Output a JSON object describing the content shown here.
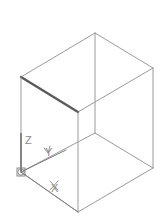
{
  "viewport": {
    "width": 168,
    "height": 224,
    "background": "#ffffff",
    "label": "CAD Model Viewport"
  },
  "model": {
    "name": "Isometric Box Wireframe",
    "projection": "isometric",
    "shape": "rectangular box",
    "edge_color": "#9a9a9a",
    "highlight_edge_color": "#5a5a5a",
    "edge_width": 1,
    "highlight_edge_width": 2.4,
    "vertices": {
      "top_back": [
        95,
        33
      ],
      "top_left": [
        21,
        77
      ],
      "top_right": [
        153,
        68
      ],
      "top_front": [
        78,
        112
      ],
      "bottom_left": [
        21,
        172
      ],
      "bottom_right": [
        153,
        168
      ],
      "bottom_front": [
        78,
        212
      ],
      "bottom_back": [
        95,
        133
      ]
    },
    "edges": [
      {
        "name": "top-back-to-top-left",
        "from": "top_back",
        "to": "top_left",
        "highlight": false
      },
      {
        "name": "top-back-to-top-right",
        "from": "top_back",
        "to": "top_right",
        "highlight": false
      },
      {
        "name": "top-left-to-top-front",
        "from": "top_left",
        "to": "top_front",
        "highlight": true
      },
      {
        "name": "top-right-to-top-front",
        "from": "top_right",
        "to": "top_front",
        "highlight": false
      },
      {
        "name": "vertical-back",
        "from": "top_back",
        "to": "bottom_back",
        "highlight": false
      },
      {
        "name": "vertical-left",
        "from": "top_left",
        "to": "bottom_left",
        "highlight": false
      },
      {
        "name": "vertical-right",
        "from": "top_right",
        "to": "bottom_right",
        "highlight": false
      },
      {
        "name": "vertical-front",
        "from": "top_front",
        "to": "bottom_front",
        "highlight": false
      },
      {
        "name": "bottom-back-to-bottom-left",
        "from": "bottom_back",
        "to": "bottom_left",
        "highlight": false
      },
      {
        "name": "bottom-back-to-bottom-right",
        "from": "bottom_back",
        "to": "bottom_right",
        "highlight": false
      },
      {
        "name": "bottom-left-to-bottom-front",
        "from": "bottom_left",
        "to": "bottom_front",
        "highlight": false
      },
      {
        "name": "bottom-right-to-bottom-front",
        "from": "bottom_right",
        "to": "bottom_front",
        "highlight": false
      }
    ]
  },
  "ucs_icon": {
    "name": "UCS coordinate axis icon",
    "origin": [
      21,
      172
    ],
    "color": "#7d7d7d",
    "axes": [
      {
        "axis": "Z",
        "label": "Z",
        "tip": [
          21,
          133
        ],
        "label_pos": [
          25,
          144
        ],
        "arrow": false
      },
      {
        "axis": "Y",
        "label": "Y",
        "tip": [
          66,
          150
        ],
        "label_pos": [
          45,
          156
        ],
        "arrow": true
      },
      {
        "axis": "X",
        "label": "X",
        "tip": [
          78,
          212
        ],
        "label_pos": [
          51,
          192
        ],
        "arrow": true
      }
    ],
    "origin_marker": "square-with-circle"
  }
}
